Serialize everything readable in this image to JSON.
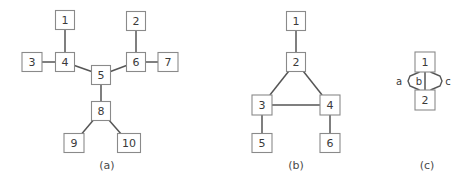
{
  "figure": {
    "background_color": "#ffffff",
    "node_fill": "#ffffff",
    "node_stroke": "#8a8a8a",
    "edge_color": "#555555",
    "text_color": "#3a3a3a"
  },
  "panels": [
    {
      "id": "a",
      "caption": "(a)",
      "caption_x": 107,
      "caption_y": 166,
      "type": "tree",
      "nodes": [
        {
          "label": "1",
          "x": 65,
          "y": 20,
          "w": 19,
          "h": 19
        },
        {
          "label": "3",
          "x": 32,
          "y": 62,
          "w": 20,
          "h": 19
        },
        {
          "label": "4",
          "x": 65,
          "y": 62,
          "w": 19,
          "h": 19
        },
        {
          "label": "5",
          "x": 101,
          "y": 75,
          "w": 19,
          "h": 19
        },
        {
          "label": "2",
          "x": 136,
          "y": 21,
          "w": 19,
          "h": 19
        },
        {
          "label": "6",
          "x": 136,
          "y": 62,
          "w": 19,
          "h": 19
        },
        {
          "label": "7",
          "x": 168,
          "y": 62,
          "w": 20,
          "h": 19
        },
        {
          "label": "8",
          "x": 101,
          "y": 111,
          "w": 19,
          "h": 19
        },
        {
          "label": "9",
          "x": 74,
          "y": 143,
          "w": 20,
          "h": 19
        },
        {
          "label": "10",
          "x": 129,
          "y": 143,
          "w": 23,
          "h": 19
        }
      ],
      "edges": [
        {
          "from": "1",
          "to": "4"
        },
        {
          "from": "3",
          "to": "4"
        },
        {
          "from": "4",
          "to": "5"
        },
        {
          "from": "5",
          "to": "6"
        },
        {
          "from": "2",
          "to": "6"
        },
        {
          "from": "6",
          "to": "7"
        },
        {
          "from": "5",
          "to": "8"
        },
        {
          "from": "8",
          "to": "9"
        },
        {
          "from": "8",
          "to": "10"
        }
      ]
    },
    {
      "id": "b",
      "caption": "(b)",
      "caption_x": 296,
      "caption_y": 166,
      "type": "graph",
      "nodes": [
        {
          "label": "1",
          "x": 296,
          "y": 21,
          "w": 19,
          "h": 19
        },
        {
          "label": "2",
          "x": 296,
          "y": 62,
          "w": 19,
          "h": 19
        },
        {
          "label": "3",
          "x": 262,
          "y": 105,
          "w": 20,
          "h": 20
        },
        {
          "label": "4",
          "x": 330,
          "y": 105,
          "w": 20,
          "h": 20
        },
        {
          "label": "5",
          "x": 262,
          "y": 143,
          "w": 20,
          "h": 19
        },
        {
          "label": "6",
          "x": 330,
          "y": 143,
          "w": 20,
          "h": 19
        }
      ],
      "edges": [
        {
          "from": "1",
          "to": "2"
        },
        {
          "from": "2",
          "to": "3"
        },
        {
          "from": "2",
          "to": "4"
        },
        {
          "from": "3",
          "to": "4"
        },
        {
          "from": "3",
          "to": "5"
        },
        {
          "from": "4",
          "to": "6"
        }
      ]
    },
    {
      "id": "c",
      "caption": "(c)",
      "caption_x": 427,
      "caption_y": 166,
      "type": "multigraph",
      "nodes": [
        {
          "label": "1",
          "x": 425,
          "y": 62,
          "w": 20,
          "h": 20
        },
        {
          "label": "2",
          "x": 425,
          "y": 100,
          "w": 20,
          "h": 20
        }
      ],
      "edges": [
        {
          "from": "1",
          "to": "2",
          "label": "a",
          "style": "left-curve",
          "label_x": 399,
          "label_y": 82
        },
        {
          "from": "1",
          "to": "2",
          "label": "b",
          "style": "straight",
          "label_x": 419,
          "label_y": 82
        },
        {
          "from": "1",
          "to": "2",
          "label": "c",
          "style": "right-curve",
          "label_x": 448,
          "label_y": 82
        }
      ]
    }
  ]
}
